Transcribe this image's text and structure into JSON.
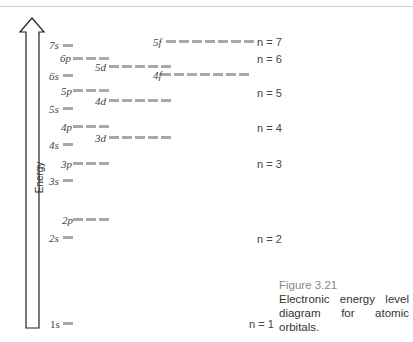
{
  "axis": {
    "label": "Energy"
  },
  "levels": [
    {
      "label": "7s",
      "n": 7,
      "count": 1
    },
    {
      "label": "6p",
      "n": 6,
      "count": 3
    },
    {
      "label": "5d",
      "n": 5,
      "count": 5
    },
    {
      "label": "6s",
      "n": 6,
      "count": 1
    },
    {
      "label": "5p",
      "n": 5,
      "count": 3
    },
    {
      "label": "4d",
      "n": 4,
      "count": 5
    },
    {
      "label": "5s",
      "n": 5,
      "count": 1
    },
    {
      "label": "4p",
      "n": 4,
      "count": 3
    },
    {
      "label": "3d",
      "n": 3,
      "count": 5
    },
    {
      "label": "4s",
      "n": 4,
      "count": 1
    },
    {
      "label": "3p",
      "n": 3,
      "count": 3
    },
    {
      "label": "3s",
      "n": 3,
      "count": 1
    },
    {
      "label": "2p",
      "n": 2,
      "count": 3
    },
    {
      "label": "2s",
      "n": 2,
      "count": 1
    },
    {
      "label": "1s",
      "n": 1,
      "count": 1
    },
    {
      "label": "5f",
      "n": 5,
      "count": 7
    },
    {
      "label": "4f",
      "n": 4,
      "count": 7
    }
  ],
  "shell_labels": [
    "n = 7",
    "n = 6",
    "n = 5",
    "n = 4",
    "n = 3",
    "n = 2",
    "n = 1"
  ],
  "caption": {
    "figure": "Figure 3.21",
    "text": "Electronic energy level diagram for atomic orbitals."
  },
  "colors": {
    "level_bar": "#a8a8a8",
    "arrow": "#222222"
  }
}
